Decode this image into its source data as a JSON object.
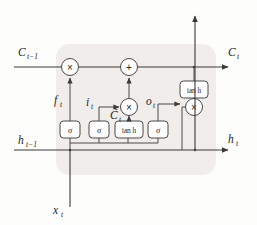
{
  "diagram": {
    "type": "lstm-cell",
    "background_color": "#fdfdfc",
    "shaded_block_color": "#edeae6",
    "line_color": "#3a3a3a",
    "signals": {
      "cell_state_in": "C",
      "cell_state_in_sub": "t−1",
      "cell_state_out": "C",
      "cell_state_out_sub": "t",
      "hidden_in": "h",
      "hidden_in_sub": "t−1",
      "hidden_out": "h",
      "hidden_out_sub": "t",
      "input": "x",
      "input_sub": "t"
    },
    "gate_labels": {
      "forget": "f",
      "forget_sub": "t",
      "input_gate": "i",
      "input_gate_sub": "t",
      "candidate": "C̃",
      "candidate_sub": "t",
      "output_gate": "o",
      "output_gate_sub": "t"
    },
    "activation_boxes": [
      {
        "id": "sigma-forget",
        "label": "σ",
        "kind": "sigmoid"
      },
      {
        "id": "sigma-input",
        "label": "σ",
        "kind": "sigmoid"
      },
      {
        "id": "tanh-candidate",
        "label": "tan h",
        "kind": "tanh"
      },
      {
        "id": "sigma-output",
        "label": "σ",
        "kind": "sigmoid"
      },
      {
        "id": "tanh-cell",
        "label": "tan h",
        "kind": "tanh"
      }
    ],
    "operator_nodes": [
      {
        "id": "mul-forget",
        "symbol": "×",
        "op": "multiply"
      },
      {
        "id": "add-cell",
        "symbol": "+",
        "op": "add"
      },
      {
        "id": "mul-input",
        "symbol": "×",
        "op": "multiply"
      },
      {
        "id": "mul-output",
        "symbol": "×",
        "op": "multiply"
      }
    ]
  }
}
